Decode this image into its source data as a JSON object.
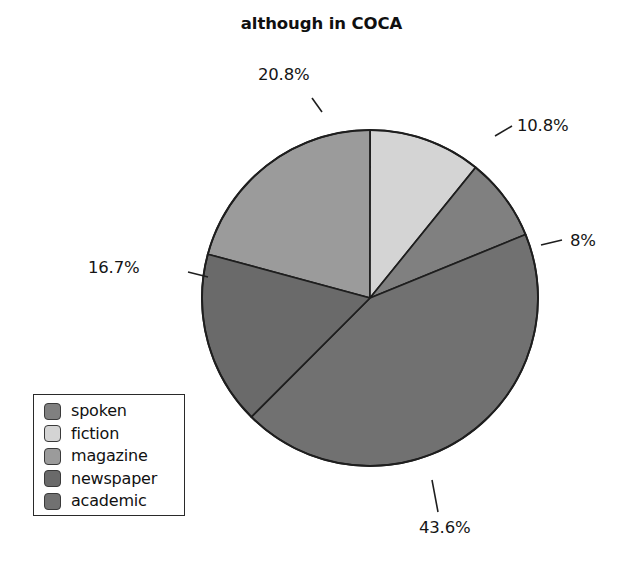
{
  "chart_data": {
    "type": "pie",
    "title": "although in COCA",
    "categories": [
      "spoken",
      "fiction",
      "magazine",
      "newspaper",
      "academic"
    ],
    "values": [
      8.0,
      10.8,
      20.8,
      16.7,
      43.6
    ],
    "value_labels": [
      "8%",
      "10.8%",
      "20.8%",
      "16.7%",
      "43.6%"
    ],
    "colors": [
      "#808080",
      "#d4d4d4",
      "#9b9b9b",
      "#6a6a6a",
      "#717171"
    ],
    "legend_position": "bottom-left",
    "grid": false,
    "xlabel": "",
    "ylabel": "",
    "slices": [
      {
        "name": "magazine",
        "label": "20.8%",
        "value": 20.8,
        "color": "#9b9b9b"
      },
      {
        "name": "fiction",
        "label": "10.8%",
        "value": 10.8,
        "color": "#d4d4d4"
      },
      {
        "name": "spoken",
        "label": "8%",
        "value": 8.0,
        "color": "#808080"
      },
      {
        "name": "academic",
        "label": "43.6%",
        "value": 43.6,
        "color": "#717171"
      },
      {
        "name": "newspaper",
        "label": "16.7%",
        "value": 16.7,
        "color": "#6a6a6a"
      }
    ]
  },
  "title": "although in COCA",
  "labels": {
    "magazine": "20.8%",
    "fiction": "10.8%",
    "spoken": "8%",
    "newspaper": "16.7%",
    "academic": "43.6%"
  },
  "legend": {
    "items": [
      {
        "label": "spoken",
        "color": "#808080"
      },
      {
        "label": "fiction",
        "color": "#d4d4d4"
      },
      {
        "label": "magazine",
        "color": "#9b9b9b"
      },
      {
        "label": "newspaper",
        "color": "#6a6a6a"
      },
      {
        "label": "academic",
        "color": "#717171"
      }
    ]
  }
}
